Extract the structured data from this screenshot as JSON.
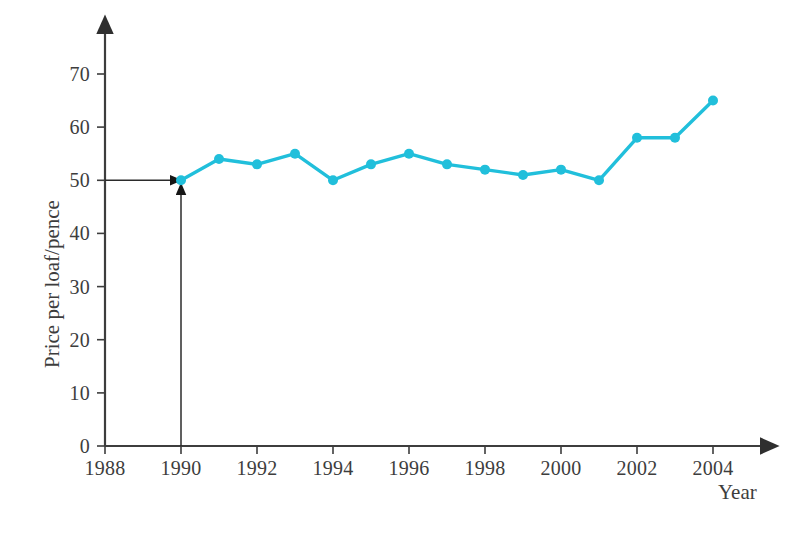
{
  "chart_data": {
    "type": "line",
    "title": "",
    "xlabel": "Year",
    "ylabel": "Price per loaf/pence",
    "x": [
      1990,
      1991,
      1992,
      1993,
      1994,
      1995,
      1996,
      1997,
      1998,
      1999,
      2000,
      2001,
      2002,
      2003,
      2004
    ],
    "values": [
      50,
      54,
      53,
      55,
      50,
      53,
      55,
      53,
      52,
      51,
      52,
      50,
      58,
      58,
      65
    ],
    "series": [
      {
        "name": "Price per loaf",
        "values": [
          50,
          54,
          53,
          55,
          50,
          53,
          55,
          53,
          52,
          51,
          52,
          50,
          58,
          58,
          65
        ]
      }
    ],
    "xlim": [
      1988,
      2004.6
    ],
    "ylim": [
      0,
      74
    ],
    "x_ticks": [
      1988,
      1990,
      1992,
      1994,
      1996,
      1998,
      2000,
      2002,
      2004
    ],
    "x_tick_labels": [
      "1988",
      "1990",
      "1992",
      "1994",
      "1996",
      "1998",
      "2000",
      "2002",
      "2004"
    ],
    "y_ticks": [
      0,
      10,
      20,
      30,
      40,
      50,
      60,
      70
    ],
    "y_tick_labels": [
      "0",
      "10",
      "20",
      "30",
      "40",
      "50",
      "60",
      "70"
    ],
    "grid": false,
    "legend": "none",
    "line_color": "#21BFDB",
    "marker": "circle",
    "marker_color": "#21BFDB",
    "axis_color": "#3d3d3d",
    "annotations": [
      {
        "name": "horizontal-reading-arrow",
        "from_value": 50,
        "to_x": 1990,
        "to_y": 50,
        "direction": "right",
        "description": "Arrow from y-axis at 50 pointing right to the 1990 data point"
      },
      {
        "name": "vertical-reading-arrow",
        "from_x": 1990,
        "to_x": 1990,
        "to_y": 50,
        "direction": "up",
        "description": "Arrow from x-axis at 1990 pointing up to the 1990 data point"
      }
    ]
  }
}
